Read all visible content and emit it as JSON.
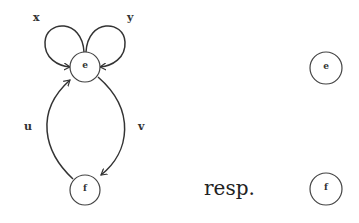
{
  "diagram": {
    "left_graph": {
      "nodes": [
        {
          "id": "e",
          "label": "e"
        },
        {
          "id": "f",
          "label": "f"
        }
      ],
      "edges": [
        {
          "label": "x",
          "from": "e",
          "to": "e",
          "type": "loop-left"
        },
        {
          "label": "y",
          "from": "e",
          "to": "e",
          "type": "loop-right"
        },
        {
          "label": "u",
          "from": "f",
          "to": "e"
        },
        {
          "label": "v",
          "from": "e",
          "to": "f"
        }
      ]
    },
    "separator_text": "resp.",
    "right_graph": {
      "nodes": [
        {
          "id": "e",
          "label": "e"
        },
        {
          "id": "f",
          "label": "f"
        }
      ],
      "edges": []
    }
  }
}
